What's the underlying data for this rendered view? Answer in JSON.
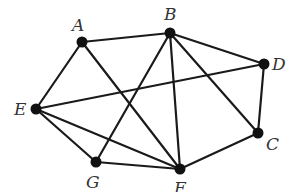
{
  "diagram": {
    "type": "undirected-graph",
    "colors": {
      "edge": "#1a1a1a",
      "node": "#111111",
      "label": "#333333",
      "background": "#ffffff"
    },
    "nodes": [
      {
        "id": "A",
        "label": "A",
        "x": 82,
        "y": 42,
        "lx": 72,
        "ly": 31
      },
      {
        "id": "B",
        "label": "B",
        "x": 170,
        "y": 33,
        "lx": 164,
        "ly": 20
      },
      {
        "id": "D",
        "label": "D",
        "x": 264,
        "y": 64,
        "lx": 272,
        "ly": 70
      },
      {
        "id": "C",
        "label": "C",
        "x": 258,
        "y": 133,
        "lx": 266,
        "ly": 150
      },
      {
        "id": "E",
        "label": "E",
        "x": 36,
        "y": 109,
        "lx": 14,
        "ly": 115
      },
      {
        "id": "G",
        "label": "G",
        "x": 96,
        "y": 162,
        "lx": 86,
        "ly": 188
      },
      {
        "id": "F",
        "label": "F",
        "x": 180,
        "y": 169,
        "lx": 174,
        "ly": 194
      }
    ],
    "edges": [
      [
        "A",
        "B"
      ],
      [
        "A",
        "E"
      ],
      [
        "A",
        "F"
      ],
      [
        "B",
        "D"
      ],
      [
        "B",
        "G"
      ],
      [
        "B",
        "F"
      ],
      [
        "B",
        "C"
      ],
      [
        "D",
        "E"
      ],
      [
        "D",
        "C"
      ],
      [
        "E",
        "G"
      ],
      [
        "E",
        "F"
      ],
      [
        "G",
        "F"
      ],
      [
        "C",
        "F"
      ]
    ]
  }
}
